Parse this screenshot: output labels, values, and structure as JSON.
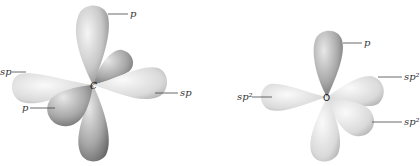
{
  "diagrams": [
    {
      "center_atom": "C",
      "labels": [
        {
          "text": "p",
          "target": "top lobe"
        },
        {
          "text": "sp",
          "target": "left lobe"
        },
        {
          "text": "sp",
          "target": "right lobe"
        },
        {
          "text": "p",
          "target": "front-left lobe"
        }
      ]
    },
    {
      "center_atom": "O",
      "labels": [
        {
          "text": "p",
          "target": "top lobe"
        },
        {
          "text": "sp2",
          "display": "sp²",
          "target": "left lobe"
        },
        {
          "text": "sp2",
          "display": "sp²",
          "target": "upper-right lobe"
        },
        {
          "text": "sp2",
          "display": "sp²",
          "target": "lower-right lobe"
        }
      ]
    }
  ]
}
